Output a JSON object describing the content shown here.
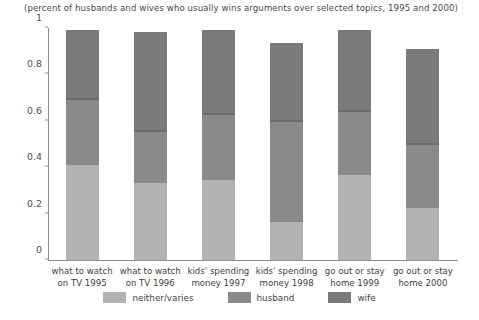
{
  "chart_data": {
    "type": "bar",
    "subtype": "stacked-bar",
    "title": "(percent of husbands and wives who usually wins arguments over selected topics, 1995 and 2000)",
    "xlabel": "",
    "ylabel": "",
    "ylim": [
      0,
      1
    ],
    "yticks": [
      0,
      0.2,
      0.4,
      0.6,
      0.8,
      1
    ],
    "ytick_labels": [
      "0",
      "0.2",
      "0.4",
      "0.6",
      "0.8",
      "1"
    ],
    "grid": false,
    "legend_position": "bottom",
    "categories": [
      "what to watch on TV 1995",
      "what to watch on TV 1996",
      "kids' spending money 1997",
      "kids' spending money 1998",
      "go out or stay home 1999",
      "go out or stay home 2000"
    ],
    "category_lines": [
      [
        "what to watch",
        "on TV 1995"
      ],
      [
        "what to watch",
        "on TV 1996"
      ],
      [
        "kids' spending",
        "money 1997"
      ],
      [
        "kids' spending",
        "money 1998"
      ],
      [
        "go out or stay",
        "home 1999"
      ],
      [
        "go out or stay",
        "home 2000"
      ]
    ],
    "series": [
      {
        "name": "neither/varies",
        "color": "#b3b3b3",
        "values": [
          0.41,
          0.33,
          0.345,
          0.165,
          0.365,
          0.225
        ]
      },
      {
        "name": "husband",
        "color": "#8a8a8a",
        "values": [
          0.29,
          0.23,
          0.29,
          0.44,
          0.28,
          0.28
        ]
      },
      {
        "name": "wife",
        "color": "#7b7b7b",
        "values": [
          0.3,
          0.43,
          0.365,
          0.34,
          0.355,
          0.415
        ]
      }
    ],
    "cumulative_tops": [
      [
        0.41,
        0.7,
        1.0
      ],
      [
        0.33,
        0.56,
        0.99
      ],
      [
        0.345,
        0.635,
        1.0
      ],
      [
        0.165,
        0.605,
        0.945
      ],
      [
        0.365,
        0.645,
        1.0
      ],
      [
        0.225,
        0.505,
        0.92
      ]
    ],
    "totals": [
      1.0,
      0.99,
      1.0,
      0.945,
      1.0,
      0.92
    ]
  },
  "legend": {
    "items": [
      {
        "label": "neither/varies",
        "color": "#b3b3b3"
      },
      {
        "label": "husband",
        "color": "#8a8a8a"
      },
      {
        "label": "wife",
        "color": "#7b7b7b"
      }
    ]
  },
  "colors": {
    "neither": "#b3b3b3",
    "husband": "#8a8a8a",
    "wife": "#7b7b7b",
    "axis": "#8e8e8e",
    "text": "#3f3f3f",
    "background": "#ffffff"
  }
}
